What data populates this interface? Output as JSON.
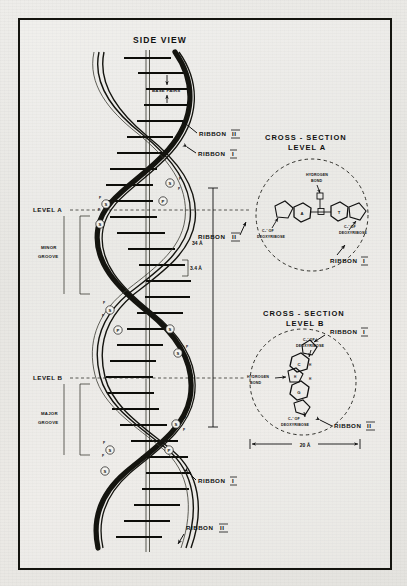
{
  "figure": {
    "background_color": "#e9e8e4",
    "ink_color": "#14140f",
    "border_color": "#14140f"
  },
  "side_view": {
    "title": "SIDE VIEW",
    "base_pairs_label": "BASE PAIRS",
    "ribbon_ii_top": "RIBBON",
    "ribbon_ii_top_numeral": "II",
    "ribbon_i_top": "RIBBON",
    "ribbon_i_top_numeral": "I",
    "ribbon_i_bottom": "RIBBON",
    "ribbon_i_bottom_numeral": "I",
    "ribbon_ii_bottom": "RIBBON",
    "ribbon_ii_bottom_numeral": "II",
    "level_a_label": "LEVEL A",
    "level_b_label": "LEVEL B",
    "minor_groove_label_line1": "MINOR",
    "minor_groove_label_line2": "GROOVE",
    "major_groove_label_line1": "MAJOR",
    "major_groove_label_line2": "GROOVE",
    "pitch_measure": "34 Å",
    "rise_measure": "3.4 Å",
    "ribbon_ii_mid": "RIBBON",
    "ribbon_ii_mid_numeral": "II",
    "backbone_units": [
      "S",
      "P"
    ],
    "sugar_symbol": "S",
    "phosphate_symbol": "P"
  },
  "cross_section_a": {
    "title_line1": "CROSS - SECTION",
    "title_line2": "LEVEL A",
    "hydrogen_bond_line1": "HYDROGEN",
    "hydrogen_bond_line2": "BOND",
    "left_sugar_line1": "C₁' OF",
    "left_sugar_line2": "DEOXYRIBOSE",
    "right_sugar_line1": "C₁' OF",
    "right_sugar_line2": "DEOXYRIBOSE",
    "base_left": "A",
    "base_right": "T",
    "bond_marks": [
      "H",
      "H"
    ],
    "ribbon_label": "RIBBON",
    "ribbon_numeral": "I",
    "ribbon_left_label": "RIBBON",
    "ribbon_left_numeral": "II"
  },
  "cross_section_b": {
    "title_line1": "CROSS - SECTION",
    "title_line2": "LEVEL B",
    "ribbon_top_label": "RIBBON",
    "ribbon_top_numeral": "I",
    "ribbon_bottom_label": "RIBBON",
    "ribbon_bottom_numeral": "II",
    "top_sugar_line1": "C₁' OF",
    "top_sugar_line2": "DEOXYRIBOSE",
    "bottom_sugar_line1": "C₁' OF",
    "bottom_sugar_line2": "DEOXYRIBOSE",
    "hydrogen_bond_line1": "HYDROGEN",
    "hydrogen_bond_line2": "BOND",
    "base_top": "C",
    "base_bottom": "G",
    "bond_marks": [
      "H",
      "H",
      "H"
    ],
    "diameter_measure": "20 Å"
  }
}
